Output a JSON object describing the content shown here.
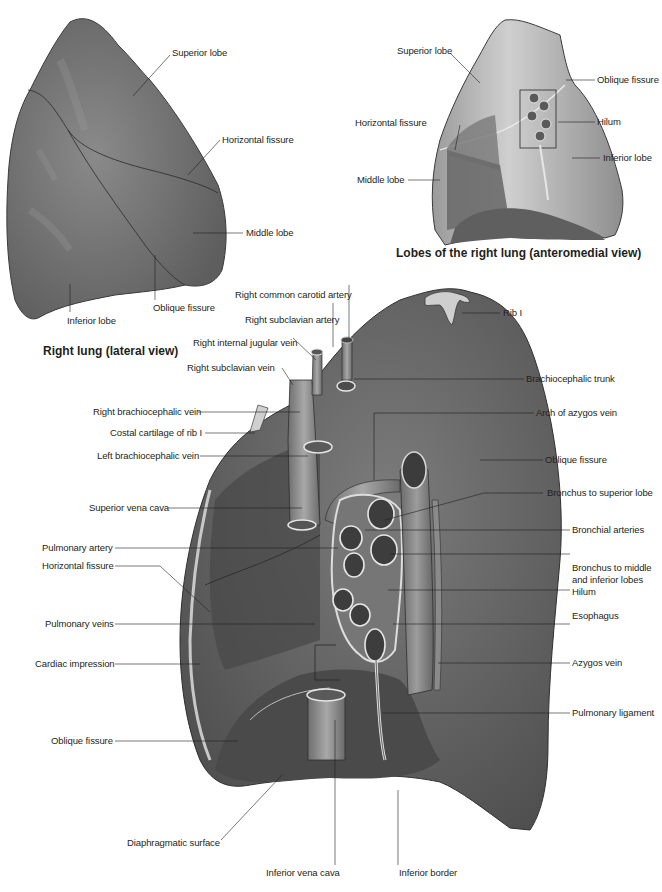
{
  "figures": {
    "lateral": {
      "caption": "Right lung (lateral view)",
      "labels": {
        "superior_lobe": "Superior lobe",
        "horizontal_fissure": "Horizontal fissure",
        "middle_lobe": "Middle lobe",
        "oblique_fissure": "Oblique fissure",
        "inferior_lobe": "Inferior lobe"
      }
    },
    "anteromedial": {
      "caption": "Lobes of the right lung (anteromedial view)",
      "labels": {
        "superior_lobe": "Superior lobe",
        "oblique_fissure": "Oblique fissure",
        "hilum": "Hilum",
        "horizontal_fissure": "Horizontal fissure",
        "inferior_lobe": "Inferior lobe",
        "middle_lobe": "Middle lobe"
      }
    },
    "medial": {
      "labels_left": {
        "right_common_carotid_artery": "Right common carotid artery",
        "right_subclavian_artery": "Right subclavian artery",
        "right_internal_jugular_vein": "Right internal jugular vein",
        "right_subclavian_vein": "Right subclavian vein",
        "right_brachiocephalic_vein": "Right brachiocephalic vein",
        "costal_cartilage_rib1": "Costal cartilage of rib I",
        "left_brachiocephalic_vein": "Left brachiocephalic vein",
        "superior_vena_cava": "Superior vena cava",
        "pulmonary_artery": "Pulmonary artery",
        "horizontal_fissure": "Horizontal fissure",
        "pulmonary_veins": "Pulmonary veins",
        "cardiac_impression": "Cardiac impression",
        "oblique_fissure": "Oblique fissure",
        "diaphragmatic_surface": "Diaphragmatic surface",
        "inferior_vena_cava": "Inferior vena cava",
        "inferior_border": "Inferior border"
      },
      "labels_right": {
        "rib1": "Rib I",
        "brachiocephalic_trunk": "Brachiocephalic trunk",
        "arch_of_azygos_vein": "Arch of azygos vein",
        "oblique_fissure": "Oblique fissure",
        "bronchus_superior_lobe": "Bronchus to superior lobe",
        "bronchial_arteries": "Bronchial arteries",
        "bronchus_middle_inferior_1": "Bronchus to middle",
        "bronchus_middle_inferior_2": "and inferior lobes",
        "hilum": "Hilum",
        "esophagus": "Esophagus",
        "azygos_vein": "Azygos vein",
        "pulmonary_ligament": "Pulmonary ligament"
      }
    }
  },
  "colors": {
    "lung_dark": "#5b5b5b",
    "lung_mid": "#7a7a7a",
    "lung_light": "#b9b9b9",
    "vessel": "#8a8a8a",
    "leader": "#231f20"
  }
}
